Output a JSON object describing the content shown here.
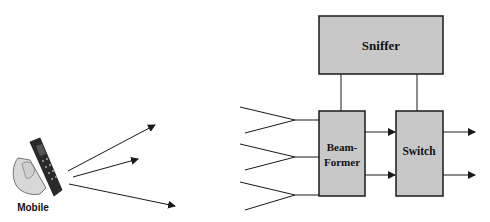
{
  "nodes": {
    "mobile": {
      "label": "Mobile"
    },
    "sniffer": {
      "label": "Sniffer"
    },
    "beamformer": {
      "label_line1": "Beam-",
      "label_line2": "Former"
    },
    "switch": {
      "label": "Switch"
    }
  },
  "colors": {
    "box_fill": "#c8c8c8",
    "stroke": "#1a1a1a",
    "phone_body": "#2a2a2a",
    "hand": "#d8d8d8"
  },
  "structure": {
    "mobile_signal_arrows": 3,
    "antennas": 3,
    "beamformer_to_switch_arrows": 2,
    "switch_outputs": 2
  }
}
